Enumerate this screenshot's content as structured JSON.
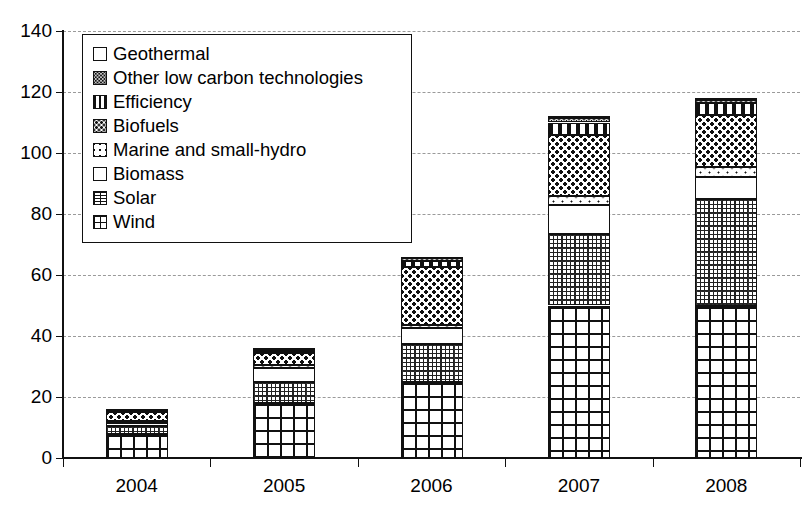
{
  "chart_data": {
    "type": "bar",
    "stacked": true,
    "title": "",
    "xlabel": "",
    "ylabel": "",
    "ylim": [
      0,
      140
    ],
    "ytick_values": [
      0,
      20,
      40,
      60,
      80,
      100,
      120,
      140
    ],
    "ytick_labels": [
      "0",
      "20",
      "40",
      "60",
      "80",
      "100",
      "120",
      "140"
    ],
    "grid": "horizontal-dashed",
    "legend_position": "upper-left-inside",
    "categories": [
      "2004",
      "2005",
      "2006",
      "2007",
      "2008"
    ],
    "series": [
      {
        "name": "Wind",
        "pattern": "grid",
        "values": [
          8.0,
          18.0,
          25.0,
          50.0,
          50.0
        ]
      },
      {
        "name": "Solar",
        "pattern": "fine-dotted-grid",
        "values": [
          2.5,
          7.0,
          12.5,
          23.5,
          35.0
        ]
      },
      {
        "name": "Biomass",
        "pattern": "white",
        "values": [
          1.0,
          4.5,
          5.0,
          9.5,
          7.0
        ]
      },
      {
        "name": "Marine and small-hydro",
        "pattern": "sparse-dots",
        "values": [
          0.5,
          1.0,
          1.0,
          3.0,
          3.5
        ]
      },
      {
        "name": "Biofuels",
        "pattern": "dark-stipple",
        "values": [
          3.0,
          4.0,
          19.0,
          20.0,
          17.0
        ]
      },
      {
        "name": "Efficiency",
        "pattern": "vertical-bars",
        "values": [
          0.7,
          0.7,
          2.0,
          4.0,
          4.0
        ]
      },
      {
        "name": "Other low carbon technologies",
        "pattern": "grey-stipple",
        "values": [
          0.3,
          0.5,
          1.0,
          1.5,
          1.0
        ]
      },
      {
        "name": "Geothermal",
        "pattern": "solid-black",
        "values": [
          0.2,
          0.3,
          0.5,
          0.5,
          0.5
        ]
      }
    ],
    "totals": [
      16.2,
      36.0,
      66.0,
      112.0,
      118.0
    ]
  },
  "legend": {
    "items": [
      {
        "label": "Geothermal",
        "pattern_class": "pat-geothermal"
      },
      {
        "label": "Other low carbon technologies",
        "pattern_class": "pat-other"
      },
      {
        "label": "Efficiency",
        "pattern_class": "pat-efficiency"
      },
      {
        "label": "Biofuels",
        "pattern_class": "pat-biofuels"
      },
      {
        "label": "Marine and small-hydro",
        "pattern_class": "pat-marine"
      },
      {
        "label": "Biomass",
        "pattern_class": "pat-biomass"
      },
      {
        "label": "Solar",
        "pattern_class": "pat-solar"
      },
      {
        "label": "Wind",
        "pattern_class": "pat-wind"
      }
    ]
  },
  "colors": {
    "ink": "#111111",
    "grid": "#9a9a9a",
    "background": "#ffffff"
  }
}
